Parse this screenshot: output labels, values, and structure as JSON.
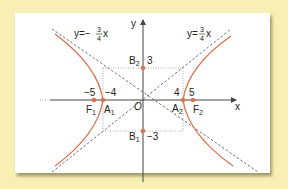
{
  "diagram": {
    "type": "hyperbola",
    "equation_params": {
      "a": 4,
      "b": 3,
      "c": 5
    },
    "axes": {
      "x_label": "x",
      "y_label": "y",
      "origin_label": "O"
    },
    "asymptotes": [
      {
        "label_lhs": "y=",
        "sign": "",
        "num": "3",
        "den": "4",
        "var": "x"
      },
      {
        "label_lhs": "y=",
        "sign": "−",
        "num": "3",
        "den": "4",
        "var": "x"
      }
    ],
    "points": [
      {
        "name": "A",
        "sub": "1",
        "value_label": "−4"
      },
      {
        "name": "A",
        "sub": "2",
        "value_label": "4"
      },
      {
        "name": "F",
        "sub": "1",
        "value_label": "−5"
      },
      {
        "name": "F",
        "sub": "2",
        "value_label": "5"
      },
      {
        "name": "B",
        "sub": "1",
        "value_label": "−3"
      },
      {
        "name": "B",
        "sub": "2",
        "value_label": "3"
      }
    ],
    "colors": {
      "curve": "#e0704a",
      "point": "#e0704a",
      "axis": "#444444",
      "asymptote": "#556070",
      "background": "#f7efb4",
      "card": "#ffffff"
    }
  }
}
